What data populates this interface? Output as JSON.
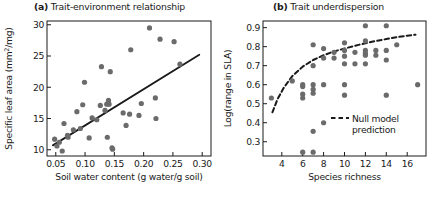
{
  "figure": {
    "background": "#ffffff",
    "point_color": "#6b6b6b",
    "line_color": "#1a1a1a"
  },
  "chart_data": [
    {
      "id": "panel-a",
      "type": "scatter",
      "panel_tag": "(a)",
      "title": "Trait-environment relationship",
      "xlabel": "Soil water content (g water/g soil)",
      "ylabel_prefix": "Specific leaf area (mm",
      "ylabel_sup": "2",
      "ylabel_suffix": "/mg)",
      "ylabel_full": "Specific leaf area (mm2/mg)",
      "xlim": [
        0.035,
        0.315
      ],
      "ylim": [
        9.0,
        30.6
      ],
      "xticks": [
        0.05,
        0.1,
        0.15,
        0.2,
        0.25,
        0.3
      ],
      "xticklabels": [
        "0.05",
        "0.10",
        "0.15",
        "0.20",
        "0.25",
        "0.30"
      ],
      "yticks": [
        10,
        15,
        20,
        25,
        30
      ],
      "yticklabels": [
        "10",
        "15",
        "20",
        "25",
        "30"
      ],
      "grid": false,
      "legend": null,
      "points": [
        [
          0.048,
          11.7
        ],
        [
          0.052,
          10.6
        ],
        [
          0.056,
          11.2
        ],
        [
          0.061,
          9.8
        ],
        [
          0.064,
          14.2
        ],
        [
          0.07,
          12.3
        ],
        [
          0.071,
          12.0
        ],
        [
          0.08,
          13.2
        ],
        [
          0.086,
          16.1
        ],
        [
          0.092,
          13.4
        ],
        [
          0.096,
          17.2
        ],
        [
          0.099,
          20.8
        ],
        [
          0.107,
          11.9
        ],
        [
          0.112,
          15.1
        ],
        [
          0.12,
          14.8
        ],
        [
          0.126,
          17.1
        ],
        [
          0.128,
          23.3
        ],
        [
          0.134,
          16.3
        ],
        [
          0.137,
          17.3
        ],
        [
          0.138,
          12.0
        ],
        [
          0.14,
          17.9
        ],
        [
          0.141,
          17.3
        ],
        [
          0.143,
          22.5
        ],
        [
          0.146,
          10.3
        ],
        [
          0.147,
          10.1
        ],
        [
          0.165,
          15.9
        ],
        [
          0.17,
          13.9
        ],
        [
          0.176,
          15.7
        ],
        [
          0.178,
          26.0
        ],
        [
          0.192,
          15.5
        ],
        [
          0.196,
          17.4
        ],
        [
          0.21,
          29.5
        ],
        [
          0.22,
          18.3
        ],
        [
          0.221,
          15.0
        ],
        [
          0.228,
          27.7
        ],
        [
          0.252,
          27.3
        ],
        [
          0.262,
          23.7
        ]
      ],
      "trend_line": {
        "style": "solid",
        "x": [
          0.045,
          0.295
        ],
        "y": [
          10.7,
          25.2
        ]
      }
    },
    {
      "id": "panel-b",
      "type": "scatter",
      "panel_tag": "(b)",
      "title": "Trait underdispersion",
      "xlabel": "Species richness",
      "ylabel_full": "Log(range in SLA)",
      "xlim": [
        2.2,
        17.8
      ],
      "ylim": [
        0.225,
        0.935
      ],
      "xticks": [
        4,
        6,
        8,
        10,
        12,
        14,
        16
      ],
      "xticklabels": [
        "4",
        "6",
        "8",
        "10",
        "12",
        "14",
        "16"
      ],
      "yticks": [
        0.3,
        0.4,
        0.5,
        0.6,
        0.7,
        0.8,
        0.9
      ],
      "yticklabels": [
        "0.3",
        "0.4",
        "0.5",
        "0.6",
        "0.7",
        "0.8",
        "0.9"
      ],
      "grid": false,
      "legend": {
        "position": "bottom-right",
        "entries": [
          {
            "label_line1": "Null model",
            "label_line2": "prediction",
            "style": "dashed"
          }
        ]
      },
      "points": [
        [
          3,
          0.53
        ],
        [
          5,
          0.62
        ],
        [
          6,
          0.59
        ],
        [
          6,
          0.6
        ],
        [
          6,
          0.55
        ],
        [
          6,
          0.53
        ],
        [
          6,
          0.245
        ],
        [
          7,
          0.81
        ],
        [
          7,
          0.7
        ],
        [
          7,
          0.6
        ],
        [
          7,
          0.575
        ],
        [
          7,
          0.555
        ],
        [
          7,
          0.355
        ],
        [
          7,
          0.245
        ],
        [
          8,
          0.79
        ],
        [
          8,
          0.74
        ],
        [
          8,
          0.6
        ],
        [
          8,
          0.4
        ],
        [
          9,
          0.77
        ],
        [
          9,
          0.74
        ],
        [
          10,
          0.82
        ],
        [
          10,
          0.78
        ],
        [
          10,
          0.75
        ],
        [
          10,
          0.71
        ],
        [
          10,
          0.6
        ],
        [
          10,
          0.545
        ],
        [
          11,
          0.77
        ],
        [
          11,
          0.71
        ],
        [
          12,
          0.91
        ],
        [
          12,
          0.83
        ],
        [
          12,
          0.78
        ],
        [
          12,
          0.765
        ],
        [
          12,
          0.755
        ],
        [
          12,
          0.71
        ],
        [
          13,
          0.78
        ],
        [
          13,
          0.755
        ],
        [
          14,
          0.91
        ],
        [
          14,
          0.78
        ],
        [
          14,
          0.73
        ],
        [
          14,
          0.545
        ],
        [
          15,
          0.81
        ],
        [
          17,
          0.6
        ]
      ],
      "null_model_curve": {
        "style": "dashed",
        "x": [
          3.1,
          3.6,
          4.2,
          5.0,
          6.0,
          7.0,
          8.0,
          9.0,
          10.0,
          11.0,
          12.0,
          13.0,
          14.0,
          15.0,
          16.0,
          16.8
        ],
        "y": [
          0.455,
          0.525,
          0.585,
          0.645,
          0.695,
          0.73,
          0.755,
          0.775,
          0.79,
          0.805,
          0.818,
          0.83,
          0.84,
          0.85,
          0.858,
          0.863
        ]
      }
    }
  ]
}
